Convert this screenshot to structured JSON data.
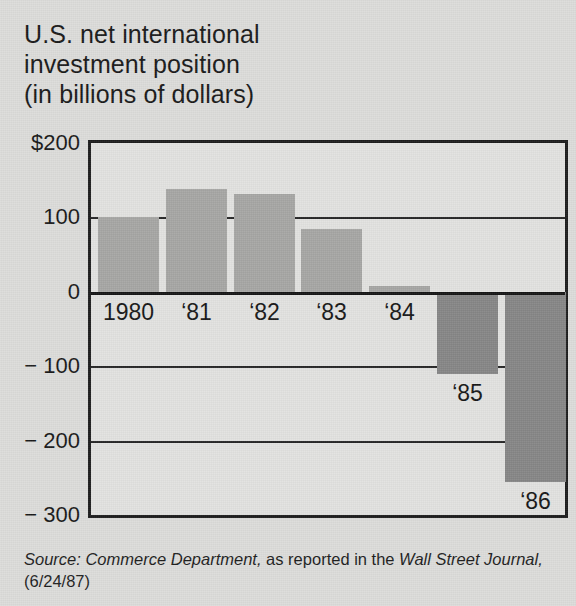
{
  "title": {
    "line1": "U.S. net international",
    "line2": "investment position",
    "line3": "(in billions of dollars)"
  },
  "source": {
    "label": "Source: Commerce Department,",
    "middle": " as reported in the ",
    "publication": "Wall Street Journal,",
    "date": " (6/24/87)"
  },
  "colors": {
    "background": "#dcdcda",
    "plot_background": "#e2e2e0",
    "positive_bar": "#a6a6a4",
    "negative_bar": "#868686",
    "axis": "#1c1c1c",
    "text": "#181818"
  },
  "chart_data": {
    "type": "bar",
    "title": "U.S. net international investment position (in billions of dollars)",
    "xlabel": "",
    "ylabel": "",
    "categories": [
      "1980",
      "‘81",
      "‘82",
      "‘83",
      "‘84",
      "‘85",
      "‘86"
    ],
    "values": [
      100,
      138,
      132,
      85,
      8,
      -110,
      -255
    ],
    "ylim": [
      -300,
      200
    ],
    "ytick_values": [
      200,
      100,
      0,
      -100,
      -200,
      -300
    ],
    "ytick_labels": [
      "$200",
      "100",
      "0",
      "− 100",
      "− 200",
      "− 300"
    ],
    "grid": true,
    "legend": "none",
    "units": "billions of dollars",
    "bar_colors": [
      "#a6a6a4",
      "#a6a6a4",
      "#a6a6a4",
      "#a6a6a4",
      "#a6a6a4",
      "#868686",
      "#868686"
    ],
    "label_positions": [
      "above-axis",
      "above-axis",
      "above-axis",
      "above-axis",
      "above-axis",
      "below-bar",
      "below-bar"
    ]
  }
}
